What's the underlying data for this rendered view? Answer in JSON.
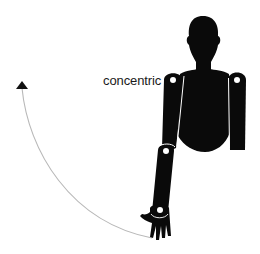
{
  "diagram": {
    "label": "concentric",
    "colors": {
      "figure": "#0a0a0a",
      "joint": "#ffffff",
      "arc": "#b8b8b8",
      "arrow": "#111111",
      "text": "#1a1a1a",
      "background": "#ffffff"
    },
    "elements": [
      {
        "name": "human-figure",
        "description": "silhouette of a torso with head and two arms"
      },
      {
        "name": "motion-arc",
        "description": "curved arrow from hand up and to the left"
      },
      {
        "name": "joint-markers",
        "count": 4
      }
    ]
  }
}
